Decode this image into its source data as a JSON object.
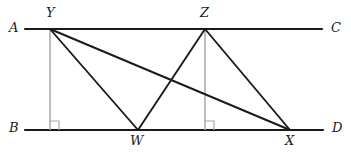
{
  "figure": {
    "canvas": {
      "width": 351,
      "height": 157
    },
    "colors": {
      "stroke_main": "#1a1a1a",
      "stroke_perpendicular": "#a8a8a8",
      "background": "#ffffff",
      "label": "#1a1a1a"
    },
    "stroke_widths": {
      "main_line": 2.2,
      "segment": 1.9,
      "perpendicular": 1.5,
      "right_angle_marker": 1.2
    }
  },
  "points": {
    "A": {
      "label": "A",
      "x": 25,
      "y": 29,
      "label_x": 9,
      "label_y": 21
    },
    "C": {
      "label": "C",
      "x": 322,
      "y": 29,
      "label_x": 331,
      "label_y": 21
    },
    "B": {
      "label": "B",
      "x": 25,
      "y": 130,
      "label_x": 9,
      "label_y": 121
    },
    "D": {
      "label": "D",
      "x": 323,
      "y": 130,
      "label_x": 332,
      "label_y": 121
    },
    "Y": {
      "label": "Y",
      "x": 50,
      "y": 29,
      "label_x": 46,
      "label_y": 6
    },
    "Z": {
      "label": "Z",
      "x": 205,
      "y": 29,
      "label_x": 200,
      "label_y": 6
    },
    "W": {
      "label": "W",
      "x": 138,
      "y": 130,
      "label_x": 130,
      "label_y": 134
    },
    "X": {
      "label": "X",
      "x": 290,
      "y": 130,
      "label_x": 285,
      "label_y": 134
    }
  },
  "lines": {
    "AC": {
      "name": "top-line-AC",
      "x1": 25,
      "y1": 29,
      "x2": 322,
      "y2": 29,
      "style": "main"
    },
    "BD": {
      "name": "bottom-line-BD",
      "x1": 25,
      "y1": 130,
      "x2": 323,
      "y2": 130,
      "style": "main"
    }
  },
  "segments": [
    {
      "name": "segment-YW",
      "from": "Y",
      "to": "W",
      "x1": 50,
      "y1": 29,
      "x2": 138,
      "y2": 130
    },
    {
      "name": "segment-YX",
      "from": "Y",
      "to": "X",
      "x1": 50,
      "y1": 29,
      "x2": 290,
      "y2": 130
    },
    {
      "name": "segment-ZW",
      "from": "Z",
      "to": "W",
      "x1": 205,
      "y1": 29,
      "x2": 138,
      "y2": 130
    },
    {
      "name": "segment-ZX",
      "from": "Z",
      "to": "X",
      "x1": 205,
      "y1": 29,
      "x2": 290,
      "y2": 130
    }
  ],
  "perpendiculars": [
    {
      "name": "perpendicular-from-Y",
      "x1": 50,
      "y1": 29,
      "x2": 50,
      "y2": 130
    },
    {
      "name": "perpendicular-from-Z",
      "x1": 205,
      "y1": 29,
      "x2": 205,
      "y2": 130
    }
  ],
  "right_angle_markers": [
    {
      "name": "right-angle-marker-at-Y-foot",
      "x": 50,
      "y": 130,
      "size": 9
    },
    {
      "name": "right-angle-marker-at-Z-foot",
      "x": 205,
      "y": 130,
      "size": 9
    }
  ]
}
